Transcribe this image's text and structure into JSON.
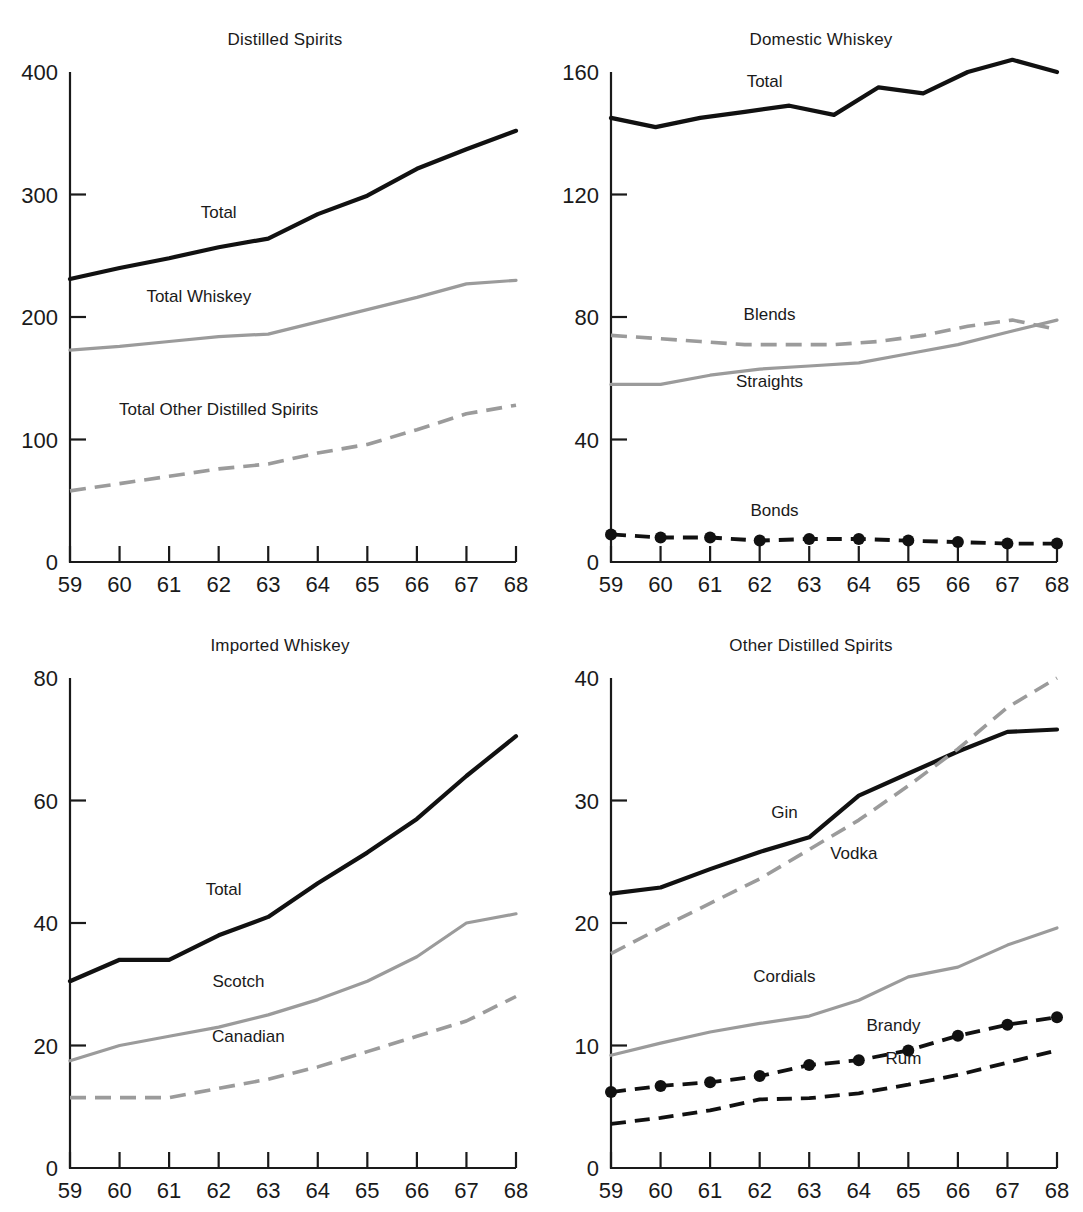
{
  "figure": {
    "panels": [
      {
        "id": "distilled-spirits",
        "title": "Distilled Spirits"
      },
      {
        "id": "domestic-whiskey",
        "title": "Domestic Whiskey"
      },
      {
        "id": "imported-whiskey",
        "title": "Imported Whiskey"
      },
      {
        "id": "other-spirits",
        "title": "Other Distilled Spirits"
      }
    ]
  },
  "chart_data": [
    {
      "type": "line",
      "title": "Distilled Spirits",
      "xlabel": "",
      "ylabel": "",
      "x": [
        "59",
        "60",
        "61",
        "62",
        "63",
        "64",
        "65",
        "66",
        "67",
        "68"
      ],
      "xlim": [
        59,
        68
      ],
      "ylim": [
        0,
        400
      ],
      "yticks": [
        "0",
        "100",
        "200",
        "300",
        "400"
      ],
      "ytick_values": [
        0,
        100,
        200,
        300,
        400
      ],
      "xticks": [
        "59",
        "60",
        "61",
        "62",
        "63",
        "64",
        "65",
        "66",
        "67",
        "68"
      ],
      "grid": false,
      "legend": "inline-labels",
      "series": [
        {
          "name": "Total",
          "style": "solid-dark",
          "label_x": 62,
          "label_y": 281,
          "values": [
            231,
            240,
            248,
            257,
            264,
            284,
            299,
            321,
            337,
            352
          ]
        },
        {
          "name": "Total Whiskey",
          "style": "solid-gray",
          "label_x": 61.6,
          "label_y": 212,
          "values": [
            173,
            176,
            180,
            184,
            186,
            196,
            206,
            216,
            227,
            230
          ]
        },
        {
          "name": "Total Other Distilled Spirits",
          "style": "dash-gray",
          "label_x": 62,
          "label_y": 120,
          "values": [
            58,
            64,
            70,
            76,
            80,
            89,
            96,
            108,
            121,
            128
          ]
        }
      ]
    },
    {
      "type": "line",
      "title": "Domestic Whiskey",
      "xlabel": "",
      "ylabel": "",
      "x": [
        "59",
        "60",
        "61",
        "62",
        "63",
        "64",
        "65",
        "66",
        "67",
        "68"
      ],
      "xlim": [
        59,
        68
      ],
      "ylim": [
        0,
        160
      ],
      "yticks": [
        "0",
        "40",
        "80",
        "120",
        "160"
      ],
      "ytick_values": [
        0,
        40,
        80,
        120,
        160
      ],
      "xticks": [
        "59",
        "60",
        "61",
        "62",
        "63",
        "64",
        "65",
        "66",
        "67",
        "68"
      ],
      "grid": false,
      "legend": "inline-labels",
      "series": [
        {
          "name": "Total",
          "style": "solid-dark",
          "label_x": 62.1,
          "label_y": 155,
          "values": [
            145,
            142,
            145,
            147,
            149,
            146,
            155,
            153,
            160,
            164,
            160
          ]
        },
        {
          "name": "Blends",
          "style": "dash-gray",
          "label_x": 62.2,
          "label_y": 79,
          "values": [
            74,
            73,
            72,
            71,
            71,
            71,
            72,
            74,
            77,
            79,
            76
          ]
        },
        {
          "name": "Straights",
          "style": "solid-gray",
          "label_x": 62.2,
          "label_y": 57,
          "values": [
            58,
            58,
            61,
            63,
            64,
            65,
            68,
            71,
            75,
            79
          ]
        },
        {
          "name": "Bonds",
          "style": "dash-dark-dots",
          "label_x": 62.3,
          "label_y": 15,
          "values": [
            9,
            8,
            8,
            7,
            7.5,
            7.5,
            7,
            6.5,
            6,
            6
          ]
        }
      ]
    },
    {
      "type": "line",
      "title": "Imported Whiskey",
      "xlabel": "",
      "ylabel": "",
      "x": [
        "59",
        "60",
        "61",
        "62",
        "63",
        "64",
        "65",
        "66",
        "67",
        "68"
      ],
      "xlim": [
        59,
        68
      ],
      "ylim": [
        0,
        80
      ],
      "yticks": [
        "0",
        "20",
        "40",
        "60",
        "80"
      ],
      "ytick_values": [
        0,
        20,
        40,
        60,
        80
      ],
      "xticks": [
        "59",
        "60",
        "61",
        "62",
        "63",
        "64",
        "65",
        "66",
        "67",
        "68"
      ],
      "grid": false,
      "legend": "inline-labels",
      "series": [
        {
          "name": "Total",
          "style": "solid-dark",
          "label_x": 62.1,
          "label_y": 44.5,
          "values": [
            30.5,
            34,
            34,
            38,
            41,
            46.5,
            51.5,
            57,
            64,
            70.5
          ]
        },
        {
          "name": "Scotch",
          "style": "solid-gray",
          "label_x": 62.4,
          "label_y": 29.5,
          "values": [
            17.5,
            20,
            21.5,
            23,
            25,
            27.5,
            30.5,
            34.5,
            40,
            41.5
          ]
        },
        {
          "name": "Canadian",
          "style": "dash-gray",
          "label_x": 62.6,
          "label_y": 20.5,
          "values": [
            11.5,
            11.5,
            11.5,
            13,
            14.5,
            16.5,
            19,
            21.5,
            24,
            28
          ]
        }
      ]
    },
    {
      "type": "line",
      "title": "Other Distilled Spirits",
      "xlabel": "",
      "ylabel": "",
      "x": [
        "59",
        "60",
        "61",
        "62",
        "63",
        "64",
        "65",
        "66",
        "67",
        "68"
      ],
      "xlim": [
        59,
        68
      ],
      "ylim": [
        0,
        40
      ],
      "yticks": [
        "0",
        "10",
        "20",
        "30",
        "40"
      ],
      "ytick_values": [
        0,
        10,
        20,
        30,
        40
      ],
      "xticks": [
        "59",
        "60",
        "61",
        "62",
        "63",
        "64",
        "65",
        "66",
        "67",
        "68"
      ],
      "grid": false,
      "legend": "inline-labels",
      "series": [
        {
          "name": "Gin",
          "style": "solid-dark",
          "label_x": 62.5,
          "label_y": 28.6,
          "values": [
            22.4,
            22.9,
            24.4,
            25.8,
            27,
            30.4,
            32.2,
            34,
            35.6,
            35.8
          ]
        },
        {
          "name": "Vodka",
          "style": "dash-gray",
          "label_x": 63.9,
          "label_y": 25.2,
          "values": [
            17.5,
            19.6,
            21.6,
            23.6,
            26,
            28.4,
            31.2,
            34.2,
            37.6,
            40
          ]
        },
        {
          "name": "Cordials",
          "style": "solid-gray",
          "label_x": 62.5,
          "label_y": 15.2,
          "values": [
            9.2,
            10.2,
            11.1,
            11.8,
            12.4,
            13.7,
            15.6,
            16.4,
            18.2,
            19.6
          ]
        },
        {
          "name": "Brandy",
          "style": "dash-dark-dots",
          "label_x": 64.7,
          "label_y": 11.2,
          "values": [
            6.2,
            6.7,
            7,
            7.5,
            8.4,
            8.8,
            9.6,
            10.8,
            11.7,
            12.3
          ]
        },
        {
          "name": "Rum",
          "style": "dash-dark",
          "label_x": 64.9,
          "label_y": 8.5,
          "values": [
            3.6,
            4.1,
            4.7,
            5.6,
            5.7,
            6.1,
            6.8,
            7.6,
            8.6,
            9.6
          ]
        }
      ]
    }
  ]
}
